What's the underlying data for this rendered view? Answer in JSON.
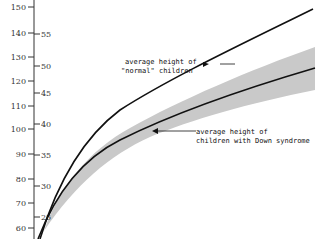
{
  "chart_data": {
    "type": "line",
    "title": "",
    "xlabel": "",
    "ylabel": "",
    "axes": {
      "left": {
        "unit": "cm",
        "ticks": [
          60,
          70,
          80,
          90,
          100,
          110,
          120,
          130,
          140,
          150
        ]
      },
      "right": {
        "unit": "in",
        "ticks": [
          25,
          30,
          35,
          40,
          45,
          50,
          55,
          60
        ]
      }
    },
    "series": [
      {
        "name": "average height of \"normal\" children",
        "approx_cm_at_right_edge": 153
      },
      {
        "name": "average height of children with Down syndrome",
        "approx_cm_at_right_edge": 127,
        "band": {
          "upper_cm": 135,
          "lower_cm": 118
        }
      }
    ],
    "grid": false,
    "legend": "annotations with arrows"
  },
  "annotations": {
    "normal_line1": "average height of",
    "normal_line2": "\"normal\" children",
    "down_line1": "average height of",
    "down_line2": "children with Down syndrome"
  },
  "left_ticks": [
    {
      "label": "150",
      "y": 7
    },
    {
      "label": "140",
      "y": 33
    },
    {
      "label": "130",
      "y": 57
    },
    {
      "label": "120",
      "y": 81
    },
    {
      "label": "110",
      "y": 106
    },
    {
      "label": "100",
      "y": 129
    },
    {
      "label": "90",
      "y": 154
    },
    {
      "label": "80",
      "y": 179
    },
    {
      "label": "70",
      "y": 203
    },
    {
      "label": "60",
      "y": 228
    }
  ],
  "right_ticks": [
    {
      "label": "55",
      "y": 34
    },
    {
      "label": "50",
      "y": 66
    },
    {
      "label": "45",
      "y": 93
    },
    {
      "label": "40",
      "y": 124
    },
    {
      "label": "35",
      "y": 155
    },
    {
      "label": "30",
      "y": 186
    },
    {
      "label": "25",
      "y": 217
    }
  ]
}
